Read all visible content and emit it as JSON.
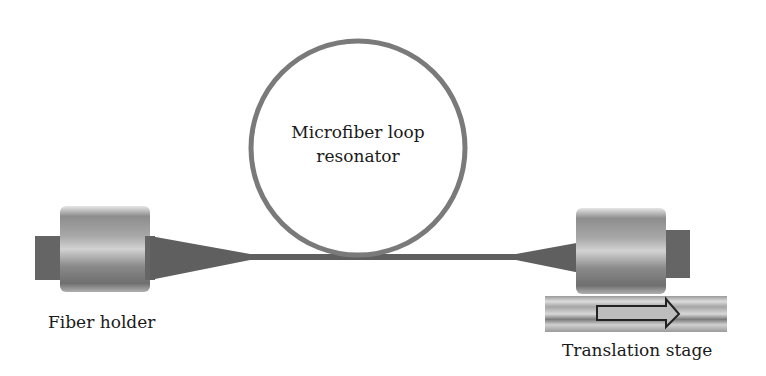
{
  "diagram": {
    "labels": {
      "loop_line1": "Microfiber loop",
      "loop_line2": "resonator",
      "left_holder": "Fiber holder",
      "right_stage": "Translation stage"
    },
    "components": [
      {
        "name": "fiber-holder-left",
        "type": "fiber holder"
      },
      {
        "name": "taper-left",
        "type": "fiber taper"
      },
      {
        "name": "microfiber-loop",
        "type": "loop resonator"
      },
      {
        "name": "taper-right",
        "type": "fiber taper"
      },
      {
        "name": "fiber-holder-right",
        "type": "fiber holder"
      },
      {
        "name": "translation-stage",
        "type": "translation stage",
        "arrow_direction": "right"
      }
    ],
    "colors": {
      "fiber": "#5f5f5f",
      "holder_dark": "#6a6a6a",
      "holder_light": "#c8c8c8",
      "loop": "#7a7a7a",
      "stage": "#b5b5b5",
      "arrow_outline": "#222222"
    }
  }
}
